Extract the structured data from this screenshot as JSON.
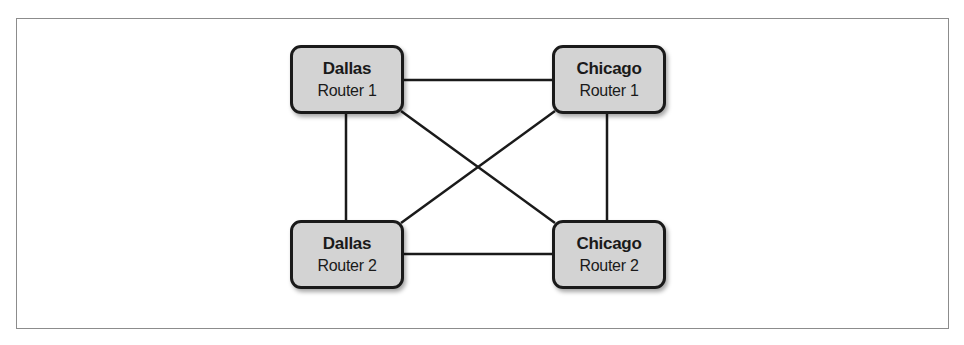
{
  "diagram": {
    "type": "network-topology",
    "colors": {
      "node_fill": "#d3d3d3",
      "node_border": "#1a1a1a",
      "link": "#1a1a1a",
      "frame_border": "#8c8c8c",
      "background": "#ffffff"
    },
    "nodes": [
      {
        "id": "dallas-r1",
        "city": "Dallas",
        "device": "Router 1",
        "x": 290,
        "y": 45
      },
      {
        "id": "chicago-r1",
        "city": "Chicago",
        "device": "Router 1",
        "x": 552,
        "y": 45
      },
      {
        "id": "dallas-r2",
        "city": "Dallas",
        "device": "Router 2",
        "x": 290,
        "y": 220
      },
      {
        "id": "chicago-r2",
        "city": "Chicago",
        "device": "Router 2",
        "x": 552,
        "y": 220
      }
    ],
    "links": [
      {
        "from": "dallas-r1",
        "to": "chicago-r1"
      },
      {
        "from": "dallas-r2",
        "to": "chicago-r2"
      },
      {
        "from": "dallas-r1",
        "to": "dallas-r2"
      },
      {
        "from": "chicago-r1",
        "to": "chicago-r2"
      },
      {
        "from": "dallas-r1",
        "to": "chicago-r2"
      },
      {
        "from": "chicago-r1",
        "to": "dallas-r2"
      }
    ]
  }
}
